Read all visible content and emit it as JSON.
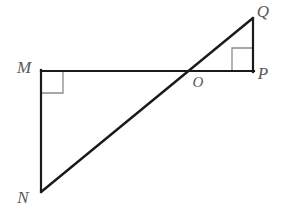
{
  "figure": {
    "type": "geometry-diagram",
    "background_color": "#ffffff",
    "stroke_color": "#1a1a1a",
    "mark_color": "#8a8a8a",
    "label_color": "#58585a"
  },
  "points": {
    "M": {
      "label": "M",
      "x": 41,
      "y": 71,
      "label_x": 24,
      "label_y": 73
    },
    "N": {
      "label": "N",
      "x": 41,
      "y": 192,
      "label_x": 23,
      "label_y": 203
    },
    "O": {
      "label": "O",
      "x": 196,
      "y": 71,
      "label_x": 198,
      "label_y": 87
    },
    "P": {
      "label": "P",
      "x": 253,
      "y": 71,
      "label_x": 261,
      "label_y": 79
    },
    "Q": {
      "label": "Q",
      "x": 253,
      "y": 18,
      "label_x": 261,
      "label_y": 16
    }
  },
  "segments": [
    {
      "name": "segment-MP",
      "from": "M",
      "to": "P",
      "x1": 41,
      "y1": 71,
      "x2": 254,
      "y2": 71,
      "width": 2.2
    },
    {
      "name": "segment-MN",
      "from": "M",
      "to": "N",
      "x1": 41,
      "y1": 70,
      "x2": 41,
      "y2": 192,
      "width": 2.2
    },
    {
      "name": "segment-QP",
      "from": "Q",
      "to": "P",
      "x1": 253,
      "y1": 18,
      "x2": 253,
      "y2": 72,
      "width": 2.2
    },
    {
      "name": "segment-NQ",
      "from": "N",
      "to": "Q",
      "x1": 41,
      "y1": 192,
      "x2": 253,
      "y2": 18,
      "width": 2.4
    }
  ],
  "right_angle_marks": [
    {
      "name": "right-angle-mark-M",
      "at_vertex": "M",
      "points": "63,71 63,93 41,93",
      "size": 22
    },
    {
      "name": "right-angle-mark-P",
      "at_vertex": "P",
      "points": "232,71 232,48 253,48",
      "size": 22
    }
  ],
  "labels": {
    "M": "M",
    "N": "N",
    "O": "O",
    "P": "P",
    "Q": "Q"
  }
}
